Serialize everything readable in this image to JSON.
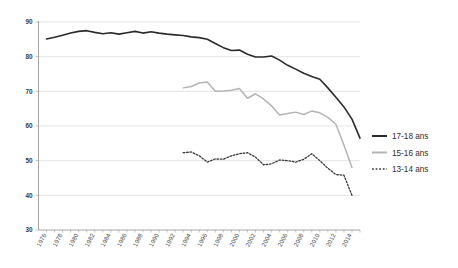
{
  "chart_data": {
    "type": "line",
    "title": "",
    "xlabel": "",
    "ylabel": "",
    "ylim": [
      30,
      90
    ],
    "ytick_step": 10,
    "yticks": [
      30,
      40,
      50,
      60,
      70,
      80,
      90
    ],
    "grid": true,
    "legend_position": "right",
    "xtick_labels": [
      "1976",
      "1978",
      "1980",
      "1982",
      "1984",
      "1986",
      "1988",
      "1990",
      "1992",
      "1994",
      "1996",
      "1998",
      "2000",
      "2002",
      "2004",
      "2006",
      "2008",
      "2010",
      "2012",
      "2014"
    ],
    "x": [
      1976,
      1977,
      1978,
      1979,
      1980,
      1981,
      1982,
      1983,
      1984,
      1985,
      1986,
      1987,
      1988,
      1989,
      1990,
      1991,
      1992,
      1993,
      1994,
      1995,
      1996,
      1997,
      1998,
      1999,
      2000,
      2001,
      2002,
      2003,
      2004,
      2005,
      2006,
      2007,
      2008,
      2009,
      2010,
      2011,
      2012,
      2013,
      2014,
      2015
    ],
    "xlim": [
      1975,
      2015
    ],
    "series": [
      {
        "name": "17-18 ans",
        "color": "#2b2b2b",
        "style": "solid",
        "width": 1.6,
        "x": [
          1976,
          1977,
          1978,
          1979,
          1980,
          1981,
          1982,
          1983,
          1984,
          1985,
          1986,
          1987,
          1988,
          1989,
          1990,
          1991,
          1992,
          1993,
          1994,
          1995,
          1996,
          1997,
          1998,
          1999,
          2000,
          2001,
          2002,
          2003,
          2004,
          2005,
          2006,
          2007,
          2008,
          2009,
          2010,
          2011,
          2012,
          2013,
          2014,
          2015
        ],
        "values": [
          85.1,
          85.6,
          86.2,
          86.8,
          87.3,
          87.5,
          87.0,
          86.6,
          86.9,
          86.5,
          86.9,
          87.3,
          86.8,
          87.2,
          86.8,
          86.5,
          86.3,
          86.1,
          85.7,
          85.5,
          85.0,
          83.8,
          82.6,
          81.8,
          81.9,
          80.7,
          79.9,
          79.9,
          80.2,
          79.0,
          77.5,
          76.4,
          75.2,
          74.3,
          73.5,
          71.0,
          68.3,
          65.5,
          62.0,
          56.5
        ]
      },
      {
        "name": "15-16 ans",
        "color": "#b4b4b4",
        "style": "solid",
        "width": 1.5,
        "x": [
          1993,
          1994,
          1995,
          1996,
          1997,
          1998,
          1999,
          2000,
          2001,
          2002,
          2003,
          2004,
          2005,
          2006,
          2007,
          2008,
          2009,
          2010,
          2011,
          2012,
          2013,
          2014
        ],
        "values": [
          71.0,
          71.4,
          72.4,
          72.7,
          70.0,
          70.1,
          70.3,
          70.8,
          68.0,
          69.3,
          67.8,
          65.8,
          63.2,
          63.6,
          64.0,
          63.3,
          64.3,
          63.8,
          62.5,
          60.5,
          54.5,
          48.0
        ]
      },
      {
        "name": "13-14 ans",
        "color": "#3a3a3a",
        "style": "dotted",
        "width": 1.3,
        "x": [
          1993,
          1994,
          1995,
          1996,
          1997,
          1998,
          1999,
          2000,
          2001,
          2002,
          2003,
          2004,
          2005,
          2006,
          2007,
          2008,
          2009,
          2010,
          2011,
          2012,
          2013,
          2014
        ],
        "values": [
          52.3,
          52.5,
          51.4,
          49.6,
          50.5,
          50.4,
          51.4,
          52.0,
          52.3,
          51.0,
          48.8,
          49.1,
          50.2,
          50.0,
          49.6,
          50.4,
          52.0,
          50.0,
          47.8,
          46.0,
          45.8,
          40.0
        ]
      }
    ]
  },
  "legend": {
    "items": [
      {
        "label": "17-18 ans",
        "swatch": "solid-dark-line-swatch"
      },
      {
        "label": "15-16 ans",
        "swatch": "solid-gray-line-swatch"
      },
      {
        "label": "13-14 ans",
        "swatch": "dotted-dark-line-swatch"
      }
    ]
  }
}
